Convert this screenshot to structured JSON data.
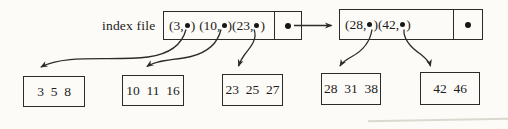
{
  "index_file": {
    "label": "index file",
    "blocks": [
      {
        "entries": [
          {
            "open": "(3,",
            "close": ")"
          },
          {
            "open": "(10,",
            "close": ")"
          },
          {
            "open": "(23,",
            "close": ")"
          }
        ]
      },
      {
        "entries": [
          {
            "open": "(28,",
            "close": ")"
          },
          {
            "open": "(42,",
            "close": ")"
          }
        ]
      }
    ]
  },
  "data_blocks": [
    {
      "values": "3  5  8"
    },
    {
      "values": "10  11  16"
    },
    {
      "values": "23  25  27"
    },
    {
      "values": "28  31  38"
    },
    {
      "values": "42  46"
    }
  ],
  "colors": {
    "line": "#2b2b2b",
    "background": "#fcfbf7",
    "text": "#1c1c1c"
  }
}
